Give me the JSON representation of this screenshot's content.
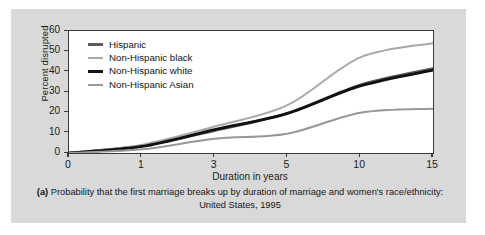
{
  "chart_data": {
    "type": "line",
    "title": "",
    "caption_prefix": "(a)",
    "caption_line1": "Probability that the first marriage breaks up by duration of marriage and",
    "caption_line2": "women's race/ethnicity: United States, 1995",
    "xlabel": "Duration in years",
    "ylabel": "Percent disrupted",
    "x": [
      0,
      1,
      3,
      5,
      10,
      15
    ],
    "xtick_labels": [
      "0",
      "1",
      "3",
      "5",
      "10",
      "15"
    ],
    "ytick_labels": [
      "0",
      "10",
      "20",
      "30",
      "40",
      "50",
      "60"
    ],
    "yticks": [
      0,
      10,
      20,
      30,
      40,
      50,
      60
    ],
    "ylim": [
      0,
      60
    ],
    "grid": false,
    "legend_position": "upper-left-inside",
    "series": [
      {
        "name": "Hispanic",
        "color": "#5a5a5a",
        "width": 2.6,
        "values": [
          0,
          3.5,
          11.0,
          19.5,
          33.5,
          41.5
        ]
      },
      {
        "name": "Non-Hispanic black",
        "color": "#a8a8a8",
        "width": 2.0,
        "values": [
          0,
          4.0,
          13.0,
          23.5,
          47.0,
          54.0
        ]
      },
      {
        "name": "Non-Hispanic white",
        "color": "#111111",
        "width": 2.8,
        "values": [
          0,
          3.2,
          11.5,
          19.5,
          33.0,
          40.8
        ]
      },
      {
        "name": "Non-Hispanic Asian",
        "color": "#989898",
        "width": 2.0,
        "values": [
          0,
          1.8,
          7.0,
          9.5,
          19.8,
          21.8
        ]
      }
    ]
  },
  "colors": {
    "panel_background": "#d9d9d9",
    "plot_background": "#ffffff",
    "axis": "#3a3a3a",
    "text": "#1c1c1c"
  }
}
